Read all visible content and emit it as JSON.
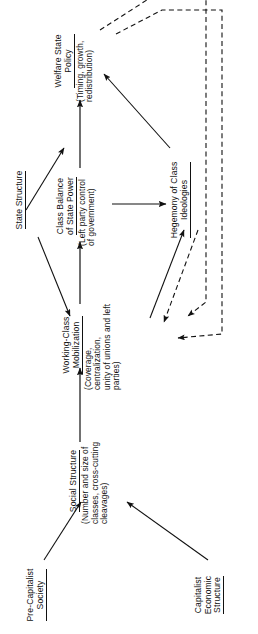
{
  "figure": {
    "kind": "causal-flow-diagram",
    "orientation": "rotated-90-counterclockwise",
    "background_color": "#ffffff",
    "line_color": "#111111"
  },
  "nodes": [
    {
      "id": "pre-capitalist-society",
      "title": "Pre-Capitalist\nSociety",
      "sub": ""
    },
    {
      "id": "capitalist-economic-structure",
      "title": "Capitalist\nEconomic\nStructure",
      "sub": ""
    },
    {
      "id": "social-structure",
      "title": "Social Structure",
      "sub": "(Number and size of\nclasses, cross-cutting\ncleavages)"
    },
    {
      "id": "working-class-mobilization",
      "title": "Working-Class\nMobilization",
      "sub": "(Coverage, centralization,\nunity of unions and left\nparties)"
    },
    {
      "id": "state-structure",
      "title": "State Structure",
      "sub": ""
    },
    {
      "id": "class-balance-of-state-power",
      "title": "Class Balance\nof State Power",
      "sub": "(Left party control\nof government)"
    },
    {
      "id": "hegemony-of-class-ideologies",
      "title": "Hegemony of Class\nIdeologies",
      "sub": ""
    },
    {
      "id": "welfare-state-policy",
      "title": "Welfare State\nPolicy",
      "sub": "(Timing, growth,\nredistribution)"
    }
  ],
  "edges": [
    {
      "id": "pre-capitalist-to-social",
      "from": "pre-capitalist-society",
      "to": "social-structure",
      "style": "solid"
    },
    {
      "id": "capitalist-to-social",
      "from": "capitalist-economic-structure",
      "to": "social-structure",
      "style": "solid"
    },
    {
      "id": "social-to-mobilization",
      "from": "social-structure",
      "to": "working-class-mobilization",
      "style": "solid"
    },
    {
      "id": "mobilization-to-class-balance",
      "from": "working-class-mobilization",
      "to": "class-balance-of-state-power",
      "style": "solid"
    },
    {
      "id": "state-structure-to-mobilization",
      "from": "state-structure",
      "to": "working-class-mobilization",
      "style": "solid"
    },
    {
      "id": "state-structure-to-policy",
      "from": "state-structure",
      "to": "welfare-state-policy",
      "style": "solid"
    },
    {
      "id": "class-balance-to-policy",
      "from": "class-balance-of-state-power",
      "to": "welfare-state-policy",
      "style": "solid"
    },
    {
      "id": "class-balance-to-hegemony",
      "from": "class-balance-of-state-power",
      "to": "hegemony-of-class-ideologies",
      "style": "solid"
    },
    {
      "id": "mobilization-to-hegemony",
      "from": "working-class-mobilization",
      "to": "hegemony-of-class-ideologies",
      "style": "solid"
    },
    {
      "id": "hegemony-to-mobilization",
      "from": "hegemony-of-class-ideologies",
      "to": "working-class-mobilization",
      "style": "dashed"
    },
    {
      "id": "hegemony-to-policy",
      "from": "hegemony-of-class-ideologies",
      "to": "welfare-state-policy",
      "style": "solid"
    },
    {
      "id": "policy-feedback-to-mobilization",
      "from": "welfare-state-policy",
      "to": "working-class-mobilization",
      "style": "dashed"
    },
    {
      "id": "policy-feedback-to-hegemony",
      "from": "welfare-state-policy",
      "to": "hegemony-of-class-ideologies",
      "style": "dashed"
    }
  ]
}
